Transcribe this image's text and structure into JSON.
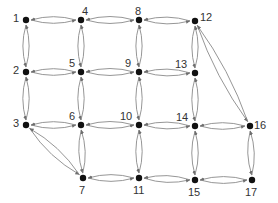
{
  "diagram": {
    "type": "directed-grid-graph",
    "node_color": "#111111",
    "edge_color": "#8a8a8a",
    "nodes": [
      {
        "id": "1",
        "x": 26,
        "y": 20,
        "lx": 13,
        "ly": 13,
        "label": "1"
      },
      {
        "id": "2",
        "x": 26,
        "y": 72,
        "lx": 13,
        "ly": 65,
        "label": "2"
      },
      {
        "id": "3",
        "x": 26,
        "y": 125,
        "lx": 13,
        "ly": 118,
        "label": "3"
      },
      {
        "id": "4",
        "x": 81,
        "y": 20,
        "lx": 82,
        "ly": 6,
        "label": "4"
      },
      {
        "id": "5",
        "x": 81,
        "y": 72,
        "lx": 69,
        "ly": 58,
        "label": "5"
      },
      {
        "id": "6",
        "x": 81,
        "y": 125,
        "lx": 69,
        "ly": 111,
        "label": "6"
      },
      {
        "id": "7",
        "x": 83,
        "y": 178,
        "lx": 79,
        "ly": 185,
        "label": "7"
      },
      {
        "id": "8",
        "x": 139,
        "y": 20,
        "lx": 135,
        "ly": 6,
        "label": "8"
      },
      {
        "id": "9",
        "x": 139,
        "y": 72,
        "lx": 125,
        "ly": 58,
        "label": "9"
      },
      {
        "id": "10",
        "x": 139,
        "y": 125,
        "lx": 120,
        "ly": 111,
        "label": "10"
      },
      {
        "id": "11",
        "x": 139,
        "y": 178,
        "lx": 133,
        "ly": 185,
        "label": "11"
      },
      {
        "id": "12",
        "x": 195,
        "y": 21,
        "lx": 200,
        "ly": 12,
        "label": "12"
      },
      {
        "id": "13",
        "x": 195,
        "y": 73,
        "lx": 175,
        "ly": 59,
        "label": "13"
      },
      {
        "id": "14",
        "x": 195,
        "y": 126,
        "lx": 176,
        "ly": 112,
        "label": "14"
      },
      {
        "id": "15",
        "x": 195,
        "y": 180,
        "lx": 188,
        "ly": 187,
        "label": "15"
      },
      {
        "id": "16",
        "x": 250,
        "y": 126,
        "lx": 254,
        "ly": 120,
        "label": "16"
      },
      {
        "id": "17",
        "x": 252,
        "y": 180,
        "lx": 245,
        "ly": 187,
        "label": "17"
      }
    ],
    "edges": [
      [
        "1",
        "4"
      ],
      [
        "4",
        "1"
      ],
      [
        "4",
        "8"
      ],
      [
        "8",
        "4"
      ],
      [
        "8",
        "12"
      ],
      [
        "12",
        "8"
      ],
      [
        "2",
        "5"
      ],
      [
        "5",
        "2"
      ],
      [
        "5",
        "9"
      ],
      [
        "9",
        "5"
      ],
      [
        "9",
        "13"
      ],
      [
        "13",
        "9"
      ],
      [
        "3",
        "6"
      ],
      [
        "6",
        "3"
      ],
      [
        "6",
        "10"
      ],
      [
        "10",
        "6"
      ],
      [
        "10",
        "14"
      ],
      [
        "14",
        "10"
      ],
      [
        "14",
        "16"
      ],
      [
        "16",
        "14"
      ],
      [
        "7",
        "11"
      ],
      [
        "11",
        "7"
      ],
      [
        "11",
        "15"
      ],
      [
        "15",
        "11"
      ],
      [
        "15",
        "17"
      ],
      [
        "17",
        "15"
      ],
      [
        "1",
        "2"
      ],
      [
        "2",
        "1"
      ],
      [
        "2",
        "3"
      ],
      [
        "3",
        "2"
      ],
      [
        "4",
        "5"
      ],
      [
        "5",
        "4"
      ],
      [
        "5",
        "6"
      ],
      [
        "6",
        "5"
      ],
      [
        "6",
        "7"
      ],
      [
        "7",
        "6"
      ],
      [
        "8",
        "9"
      ],
      [
        "9",
        "8"
      ],
      [
        "9",
        "10"
      ],
      [
        "10",
        "9"
      ],
      [
        "10",
        "11"
      ],
      [
        "11",
        "10"
      ],
      [
        "12",
        "13"
      ],
      [
        "13",
        "12"
      ],
      [
        "13",
        "14"
      ],
      [
        "14",
        "13"
      ],
      [
        "14",
        "15"
      ],
      [
        "15",
        "14"
      ],
      [
        "16",
        "17"
      ],
      [
        "17",
        "16"
      ],
      [
        "3",
        "7"
      ],
      [
        "7",
        "3"
      ],
      [
        "12",
        "16"
      ],
      [
        "16",
        "12"
      ]
    ]
  }
}
